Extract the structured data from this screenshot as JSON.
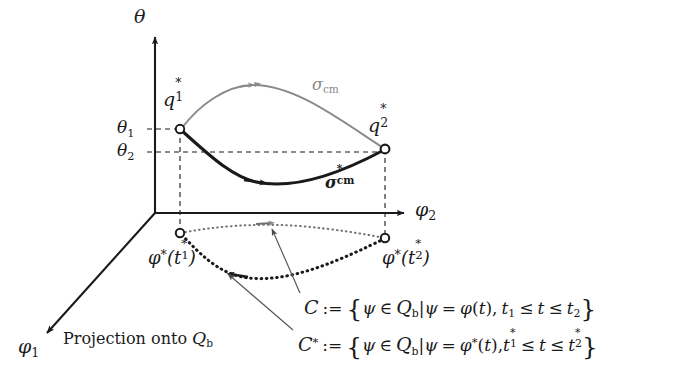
{
  "figure": {
    "background_color": "#ffffff",
    "ink_color": "#1a1a1a",
    "gray_color": "#8a8a8a"
  },
  "axes": {
    "theta": {
      "label": "θ",
      "direction": "up",
      "ticks": [
        {
          "label_symbol": "θ",
          "label_sub": "1"
        },
        {
          "label_symbol": "θ",
          "label_sub": "2"
        }
      ]
    },
    "phi2": {
      "label_symbol": "φ",
      "label_sub": "2",
      "direction": "right"
    },
    "phi1": {
      "label_symbol": "φ",
      "label_sub": "1",
      "direction": "down-left"
    }
  },
  "points": {
    "q1": {
      "symbol": "q",
      "sub": "1",
      "sup": "*"
    },
    "q2": {
      "symbol": "q",
      "sub": "2",
      "sup": "*"
    },
    "proj_start": {
      "symbol": "φ",
      "sup": "*",
      "arg_symbol": "t",
      "arg_sub": "1",
      "arg_sup": "*"
    },
    "proj_end": {
      "symbol": "φ",
      "sup": "*",
      "arg_symbol": "t",
      "arg_sub": "2",
      "arg_sup": "*"
    }
  },
  "curves": {
    "sigma_cm": {
      "label_symbol": "σ",
      "label_sub": "cm",
      "style": "solid-gray",
      "color": "#8a8a8a"
    },
    "sigma_cm_star": {
      "label_symbol": "σ",
      "label_sub": "cm",
      "label_sup": "*",
      "style": "solid-bold-black",
      "color": "#1a1a1a"
    },
    "projection_c": {
      "style": "dotted-gray",
      "color": "#6f6f6f"
    },
    "projection_c_star": {
      "style": "dotted-bold-black",
      "color": "#1a1a1a"
    }
  },
  "annotations": {
    "projection_note": "Projection onto",
    "projection_note_symbol": "Q",
    "projection_note_sub": "b"
  },
  "formulas": {
    "c": {
      "lhs": "C",
      "assign": ":=",
      "open_brace": "{",
      "psi": "ψ",
      "member": "∈",
      "space_symbol": "Q",
      "space_sub": "b",
      "bar": "|",
      "equals": "=",
      "map": "φ",
      "arg_open": "(",
      "arg": "t",
      "arg_close": ")",
      "comma": ",",
      "t_lower": "t",
      "t_lower_sub": "1",
      "leq": "≤",
      "t_var": "t",
      "t_upper": "t",
      "t_upper_sub": "2",
      "close_brace": "}"
    },
    "c_star": {
      "lhs": "C",
      "lhs_sup": "*",
      "assign": ":=",
      "open_brace": "{",
      "psi": "ψ",
      "member": "∈",
      "space_symbol": "Q",
      "space_sub": "b",
      "bar": "|",
      "equals": "=",
      "map": "φ",
      "map_sup": "*",
      "arg_open": "(",
      "arg": "t",
      "arg_close": ")",
      "comma": ",",
      "t_lower": "t",
      "t_lower_sub": "1",
      "t_lower_sup": "*",
      "leq": "≤",
      "t_var": "t",
      "t_upper": "t",
      "t_upper_sub": "2",
      "t_upper_sup": "*",
      "close_brace": "}"
    }
  }
}
